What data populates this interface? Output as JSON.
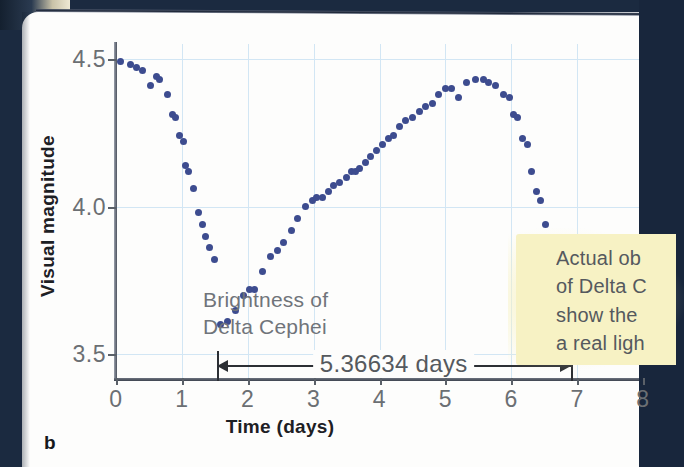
{
  "figure": {
    "panel_label": "b",
    "inplot_caption_line1": "Brightness of",
    "inplot_caption_line2": "Delta Cephei",
    "period_annotation": "5.36634 days",
    "callout_line1": "Actual ob",
    "callout_line2": "of Delta C",
    "callout_line3": "show the",
    "callout_line4": "a real ligh",
    "marker_color": "#3d4c8f",
    "grid_color": "#d2e6f4",
    "callout_color": "#f7f2c4",
    "backdrop_color": "#1b2a40"
  },
  "chart_data": {
    "type": "scatter",
    "title": "Brightness of Delta Cephei",
    "xlabel": "Time (days)",
    "ylabel": "Visual magnitude",
    "xlim": [
      0,
      8
    ],
    "ylim": [
      4.55,
      3.42
    ],
    "y_inverted": true,
    "grid": true,
    "legend": null,
    "xticks": [
      0,
      1,
      2,
      3,
      4,
      5,
      6,
      7,
      8
    ],
    "xticklabels": [
      "0",
      "1",
      "2",
      "3",
      "4",
      "5",
      "6",
      "7",
      "8"
    ],
    "yticks": [
      3.5,
      4.0,
      4.5
    ],
    "yticklabels": [
      "3.5",
      "4.0",
      "4.5"
    ],
    "annotations": [
      {
        "text": "5.36634 days",
        "x_start": 1.53,
        "x_end": 6.9,
        "y": 3.47,
        "style": "double-arrow"
      },
      {
        "text": "Brightness of Delta Cephei",
        "x": 1.62,
        "y": 4.22
      }
    ],
    "series": [
      {
        "name": "Delta Cephei visual magnitude",
        "color": "#3d4c8f",
        "x": [
          0.07,
          0.22,
          0.31,
          0.4,
          0.52,
          0.62,
          0.66,
          0.78,
          0.86,
          0.9,
          0.97,
          1.02,
          1.06,
          1.1,
          1.18,
          1.25,
          1.31,
          1.36,
          1.42,
          1.5,
          1.58,
          1.7,
          1.82,
          1.93,
          2.02,
          2.1,
          2.22,
          2.34,
          2.45,
          2.55,
          2.66,
          2.76,
          2.88,
          2.99,
          3.05,
          3.14,
          3.22,
          3.3,
          3.4,
          3.5,
          3.58,
          3.64,
          3.7,
          3.78,
          3.86,
          3.95,
          4.04,
          4.13,
          4.22,
          4.31,
          4.4,
          4.5,
          4.6,
          4.7,
          4.8,
          4.9,
          5.0,
          5.1,
          5.2,
          5.32,
          5.45,
          5.58,
          5.66,
          5.76,
          5.88,
          5.97,
          6.04,
          6.1,
          6.17,
          6.24,
          6.31,
          6.38,
          6.45,
          6.52,
          6.6,
          6.68,
          6.76,
          6.84,
          6.92,
          7.0,
          7.1,
          7.2,
          7.32,
          7.44,
          7.56,
          7.68,
          7.8,
          7.92
        ],
        "y": [
          4.49,
          4.48,
          4.47,
          4.46,
          4.41,
          4.44,
          4.43,
          4.38,
          4.31,
          4.3,
          4.24,
          4.22,
          4.14,
          4.12,
          4.06,
          3.98,
          3.94,
          3.9,
          3.86,
          3.82,
          3.6,
          3.61,
          3.65,
          3.7,
          3.72,
          3.72,
          3.78,
          3.83,
          3.85,
          3.88,
          3.92,
          3.96,
          4.0,
          4.02,
          4.03,
          4.03,
          4.05,
          4.07,
          4.08,
          4.1,
          4.12,
          4.12,
          4.13,
          4.15,
          4.17,
          4.19,
          4.21,
          4.23,
          4.24,
          4.27,
          4.29,
          4.3,
          4.32,
          4.34,
          4.35,
          4.38,
          4.4,
          4.4,
          4.37,
          4.42,
          4.43,
          4.43,
          4.42,
          4.41,
          4.38,
          4.37,
          4.31,
          4.3,
          4.23,
          4.21,
          4.12,
          4.05,
          4.02,
          3.94,
          3.88,
          3.8,
          3.73,
          3.62,
          3.6,
          3.62,
          3.66,
          3.7,
          3.73,
          3.76,
          3.76,
          3.78,
          3.82,
          3.88
        ]
      }
    ]
  }
}
